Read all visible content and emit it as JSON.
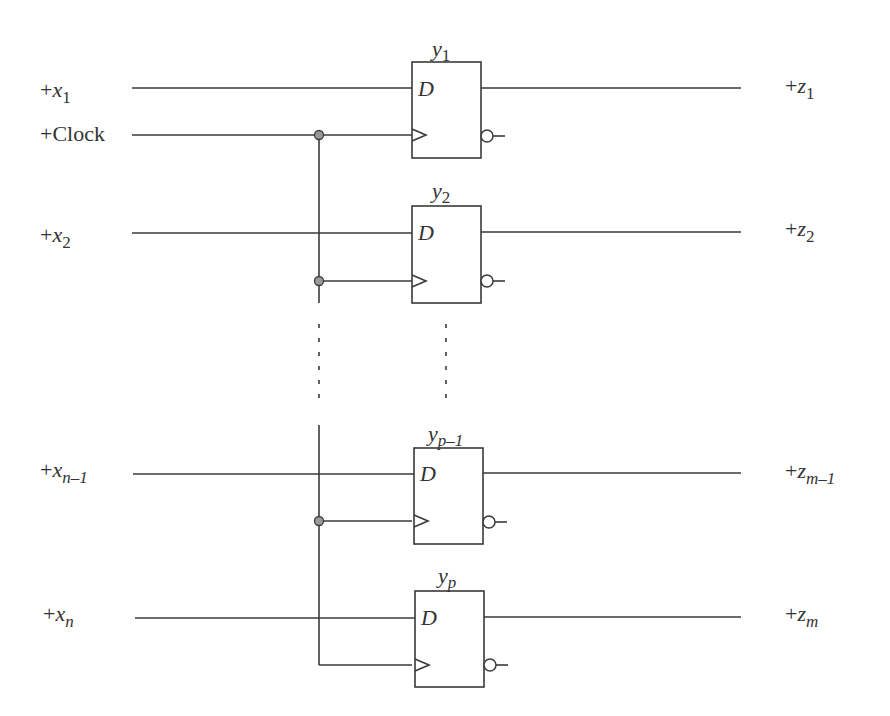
{
  "diagram": {
    "colors": {
      "line": "#3a3a3a",
      "junction": "#9a9a9a",
      "text": "#333333"
    },
    "clock_label": "+Clock",
    "d_label": "D",
    "inputs": [
      {
        "prefix": "+",
        "var": "x",
        "sub": "1"
      },
      {
        "prefix": "+",
        "var": "x",
        "sub": "2"
      },
      {
        "prefix": "+",
        "var": "x",
        "sub": "n–1"
      },
      {
        "prefix": "+",
        "var": "x",
        "sub": "n"
      }
    ],
    "flipflops": [
      {
        "var": "y",
        "sub": "1"
      },
      {
        "var": "y",
        "sub": "2"
      },
      {
        "var": "y",
        "sub": "p–1"
      },
      {
        "var": "y",
        "sub": "p"
      }
    ],
    "outputs": [
      {
        "prefix": "+",
        "var": "z",
        "sub": "1"
      },
      {
        "prefix": "+",
        "var": "z",
        "sub": "2"
      },
      {
        "prefix": "+",
        "var": "z",
        "sub": "m–1"
      },
      {
        "prefix": "+",
        "var": "z",
        "sub": "m"
      }
    ]
  }
}
